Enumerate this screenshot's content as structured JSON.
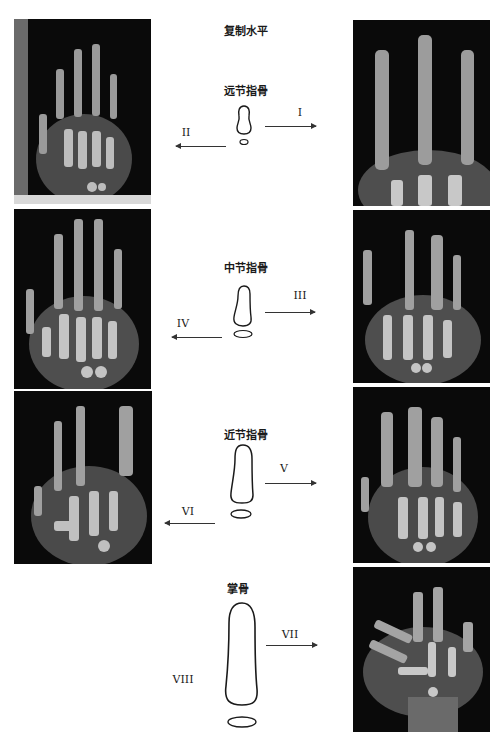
{
  "title": "复制水平",
  "stages": [
    {
      "label": "远节指骨",
      "right_numeral": "I",
      "left_numeral": "II"
    },
    {
      "label": "中节指骨",
      "right_numeral": "III",
      "left_numeral": "IV"
    },
    {
      "label": "近节指骨",
      "right_numeral": "V",
      "left_numeral": "VI"
    },
    {
      "label": "掌骨",
      "right_numeral": "VII",
      "left_numeral": "VIII"
    }
  ],
  "images": {
    "left": [
      {
        "alt": "hand x-ray II"
      },
      {
        "alt": "hand x-ray IV"
      },
      {
        "alt": "hand x-ray VI"
      }
    ],
    "right": [
      {
        "alt": "hand x-ray I"
      },
      {
        "alt": "hand x-ray III"
      },
      {
        "alt": "hand x-ray V"
      },
      {
        "alt": "hand x-ray VII"
      }
    ]
  },
  "colors": {
    "background": "#ffffff",
    "xray_bg": "#0a0a0a",
    "line": "#333333"
  }
}
